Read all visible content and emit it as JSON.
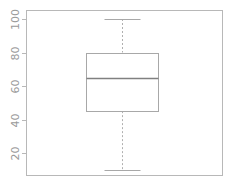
{
  "chart_data": {
    "type": "boxplot",
    "title": "",
    "xlabel": "",
    "ylabel": "",
    "ylim": [
      5,
      104
    ],
    "yticks": [
      20,
      40,
      60,
      80,
      100
    ],
    "ytick_labels": [
      "20",
      "40",
      "60",
      "80",
      "100"
    ],
    "grid": false,
    "legend": null,
    "series": [
      {
        "name": "",
        "min": 10,
        "q1": 45,
        "median": 65,
        "q3": 80,
        "max": 100
      }
    ]
  }
}
